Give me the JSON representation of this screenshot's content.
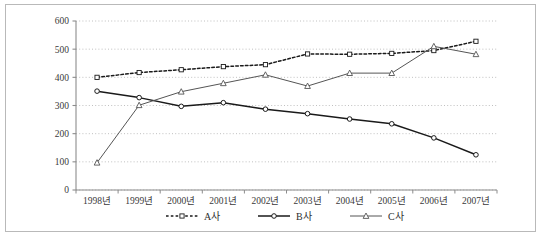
{
  "chart_data": {
    "type": "line",
    "title": "",
    "subtitle": "",
    "xlabel": "",
    "ylabel": "",
    "categories": [
      "1998년",
      "1999년",
      "2000년",
      "2001년",
      "2002년",
      "2003년",
      "2004년",
      "2005년",
      "2006년",
      "2007년"
    ],
    "x_tick_labels": [
      "1998년",
      "1999년",
      "2000년",
      "2001년",
      "2002년",
      "2003년",
      "2004년",
      "2005년",
      "2006년",
      "2007년"
    ],
    "y_tick_labels": [
      "0",
      "100",
      "200",
      "300",
      "400",
      "500",
      "600"
    ],
    "y_ticks": [
      0,
      100,
      200,
      300,
      400,
      500,
      600
    ],
    "ylim": [
      0,
      600
    ],
    "grid": "horizontal-dotted",
    "legend_position": "bottom",
    "series": [
      {
        "name": "A사",
        "style": "dotted",
        "marker": "square",
        "color": "#1a1a1a",
        "values": [
          400,
          417,
          427,
          438,
          445,
          483,
          482,
          485,
          495,
          528
        ]
      },
      {
        "name": "B사",
        "style": "solid",
        "marker": "circle",
        "color": "#1a1a1a",
        "values": [
          351,
          328,
          297,
          310,
          287,
          271,
          252,
          235,
          185,
          125
        ]
      },
      {
        "name": "C사",
        "style": "solid",
        "marker": "triangle",
        "color": "#555555",
        "values": [
          97,
          301,
          349,
          379,
          409,
          369,
          415,
          415,
          510,
          482
        ]
      }
    ]
  },
  "legend": {
    "items": [
      {
        "label": "A사"
      },
      {
        "label": "B사"
      },
      {
        "label": "C사"
      }
    ]
  },
  "colors": {
    "frame": "#b9b9b9",
    "axis": "#8c8c8c",
    "grid": "#b0b0b0",
    "series_a": "#1a1a1a",
    "series_b": "#1a1a1a",
    "series_c": "#555555",
    "text": "#3a3a3a",
    "background": "#ffffff"
  }
}
